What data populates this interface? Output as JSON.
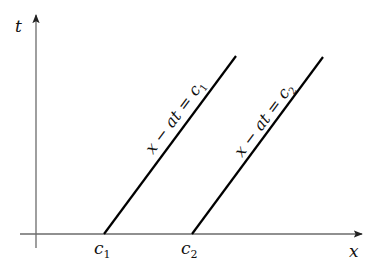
{
  "diagram": {
    "type": "characteristic lines in x-t plane",
    "axes": {
      "horizontal": {
        "label": "x",
        "direction": "right"
      },
      "vertical": {
        "label": "t",
        "direction": "up"
      }
    },
    "ticks": [
      {
        "id": "c1",
        "base": "c",
        "subscript": "1"
      },
      {
        "id": "c2",
        "base": "c",
        "subscript": "2"
      }
    ],
    "lines": [
      {
        "id": "line1",
        "equation_prefix": "x − at = c",
        "subscript": "1",
        "intercept": "c1"
      },
      {
        "id": "line2",
        "equation_prefix": "x − at = c",
        "subscript": "2",
        "intercept": "c2"
      }
    ],
    "colors": {
      "axis": "#6b6b6b",
      "line": "#000000",
      "text": "#111111"
    }
  }
}
